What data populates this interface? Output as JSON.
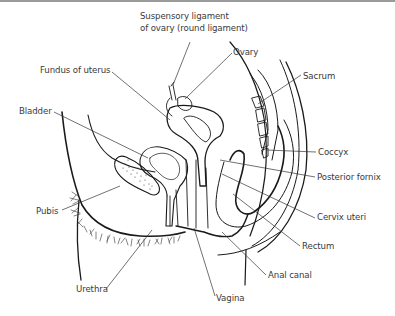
{
  "diagram": {
    "type": "anatomical-sagittal-section",
    "labels": [
      {
        "id": "suspensory",
        "line1": "Suspensory ligament",
        "line2": "of ovary (round ligament)",
        "x": 140,
        "y": 17
      },
      {
        "id": "ovary",
        "text": "Ovary",
        "x": 233,
        "y": 47
      },
      {
        "id": "sacrum",
        "text": "Sacrum",
        "x": 303,
        "y": 71
      },
      {
        "id": "fundus",
        "text": "Fundus of uterus",
        "x": 40,
        "y": 65
      },
      {
        "id": "bladder",
        "text": "Bladder",
        "x": 19,
        "y": 106
      },
      {
        "id": "coccyx",
        "text": "Coccyx",
        "x": 318,
        "y": 148
      },
      {
        "id": "posterior-fornix",
        "text": "Posterior fornix",
        "x": 317,
        "y": 173
      },
      {
        "id": "pubis",
        "text": "Pubis",
        "x": 36,
        "y": 206
      },
      {
        "id": "cervix",
        "text": "Cervix uteri",
        "x": 317,
        "y": 213
      },
      {
        "id": "rectum",
        "text": "Rectum",
        "x": 302,
        "y": 242
      },
      {
        "id": "anal-canal",
        "text": "Anal canal",
        "x": 268,
        "y": 271
      },
      {
        "id": "urethra",
        "text": "Urethra",
        "x": 76,
        "y": 285
      },
      {
        "id": "vagina",
        "text": "Vagina",
        "x": 216,
        "y": 294
      }
    ],
    "colors": {
      "line": "#1a1a1a",
      "leader": "#333333",
      "text": "#3a3a3a",
      "background": "#ffffff"
    }
  }
}
